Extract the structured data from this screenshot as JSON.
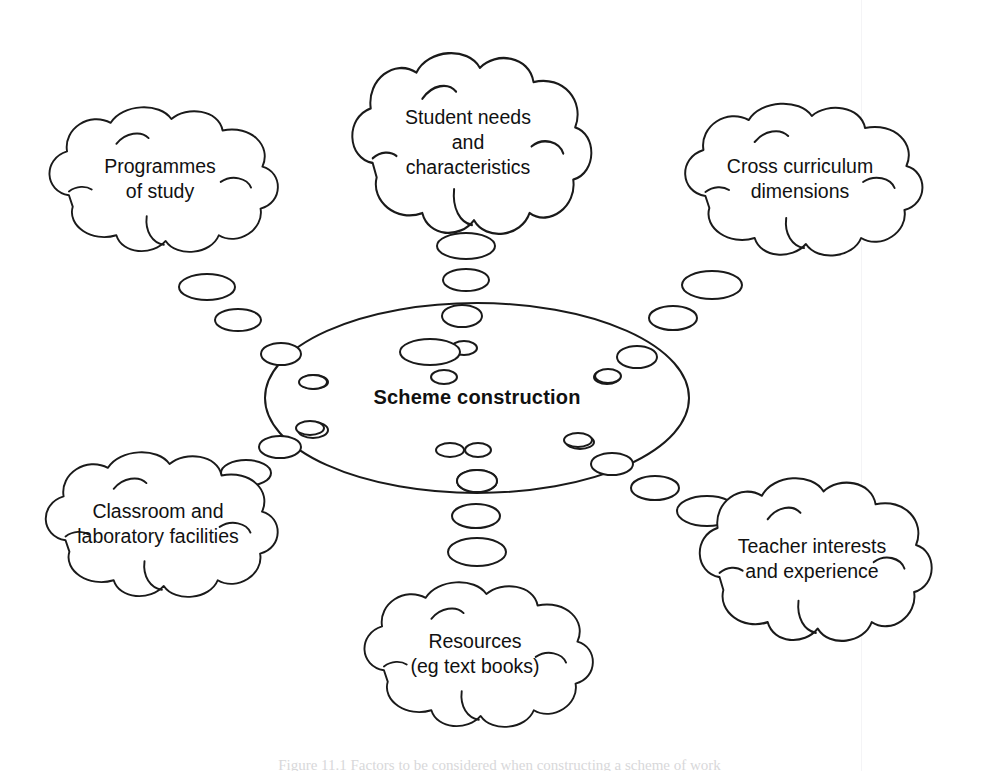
{
  "diagram": {
    "title": "Scheme construction",
    "type": "thought-bubble concept map",
    "hub": {
      "label": "Scheme construction",
      "shape": "ellipse",
      "cx": 477,
      "cy": 398,
      "rx": 212,
      "ry": 95,
      "bold": true
    },
    "stroke_color": "#1a1a1a",
    "fill_color": "#ffffff",
    "text_color": "#111111",
    "nodes": [
      {
        "id": "programmes-of-study",
        "lines": [
          "Programmes",
          "of study"
        ],
        "cx": 160,
        "cy": 180,
        "w": 258,
        "h": 160,
        "position": "top-left"
      },
      {
        "id": "student-needs",
        "lines": [
          "Student needs",
          "and",
          "characteristics"
        ],
        "cx": 468,
        "cy": 144,
        "w": 270,
        "h": 200,
        "position": "top-center"
      },
      {
        "id": "cross-curriculum-dimensions",
        "lines": [
          "Cross curriculum",
          "dimensions"
        ],
        "cx": 800,
        "cy": 180,
        "w": 268,
        "h": 168,
        "position": "top-right"
      },
      {
        "id": "classroom-laboratory-facilities",
        "lines": [
          "Classroom and",
          "laboratory facilities"
        ],
        "cx": 158,
        "cy": 525,
        "w": 262,
        "h": 160,
        "position": "bottom-left"
      },
      {
        "id": "resources",
        "lines": [
          "Resources",
          "(eg text books)"
        ],
        "cx": 475,
        "cy": 655,
        "w": 258,
        "h": 160,
        "position": "bottom-center"
      },
      {
        "id": "teacher-interests",
        "lines": [
          "Teacher interests",
          "and experience"
        ],
        "cx": 812,
        "cy": 560,
        "w": 262,
        "h": 180,
        "position": "bottom-right"
      }
    ],
    "trails": [
      {
        "from": "programmes-of-study",
        "bubbles": [
          {
            "cx": 207,
            "cy": 287,
            "rx": 28,
            "ry": 13
          },
          {
            "cx": 238,
            "cy": 320,
            "rx": 23,
            "ry": 11
          },
          {
            "cx": 281,
            "cy": 354,
            "rx": 20,
            "ry": 11
          },
          {
            "cx": 314,
            "cy": 382,
            "rx": 14,
            "ry": 7
          }
        ]
      },
      {
        "from": "student-needs",
        "bubbles": [
          {
            "cx": 466,
            "cy": 246,
            "rx": 29,
            "ry": 13
          },
          {
            "cx": 466,
            "cy": 280,
            "rx": 23,
            "ry": 11
          },
          {
            "cx": 462,
            "cy": 316,
            "rx": 20,
            "ry": 11
          },
          {
            "cx": 464,
            "cy": 348,
            "rx": 13,
            "ry": 7
          }
        ]
      },
      {
        "from": "cross-curriculum-dimensions",
        "bubbles": [
          {
            "cx": 712,
            "cy": 285,
            "rx": 30,
            "ry": 14
          },
          {
            "cx": 673,
            "cy": 318,
            "rx": 24,
            "ry": 12
          },
          {
            "cx": 637,
            "cy": 357,
            "rx": 20,
            "ry": 11
          },
          {
            "cx": 607,
            "cy": 377,
            "rx": 13,
            "ry": 7
          }
        ]
      },
      {
        "from": "classroom-laboratory-facilities",
        "bubbles": [
          {
            "cx": 246,
            "cy": 473,
            "rx": 25,
            "ry": 13
          },
          {
            "cx": 280,
            "cy": 447,
            "rx": 21,
            "ry": 11
          },
          {
            "cx": 313,
            "cy": 430,
            "rx": 15,
            "ry": 8
          },
          {
            "cx": 310,
            "cy": 424,
            "rx": 0,
            "ry": 0
          }
        ]
      },
      {
        "from": "resources",
        "bubbles": [
          {
            "cx": 477,
            "cy": 552,
            "rx": 29,
            "ry": 14
          },
          {
            "cx": 476,
            "cy": 516,
            "rx": 24,
            "ry": 12
          },
          {
            "cx": 477,
            "cy": 481,
            "rx": 20,
            "ry": 11
          },
          {
            "cx": 478,
            "cy": 450,
            "rx": 13,
            "ry": 7
          }
        ]
      },
      {
        "from": "teacher-interests",
        "bubbles": [
          {
            "cx": 707,
            "cy": 511,
            "rx": 30,
            "ry": 15
          },
          {
            "cx": 655,
            "cy": 488,
            "rx": 24,
            "ry": 12
          },
          {
            "cx": 612,
            "cy": 464,
            "rx": 21,
            "ry": 11
          },
          {
            "cx": 580,
            "cy": 442,
            "rx": 14,
            "ry": 7
          }
        ]
      }
    ]
  },
  "caption": {
    "text": "Figure 11.1  Factors to be considered when constructing a scheme of work"
  }
}
